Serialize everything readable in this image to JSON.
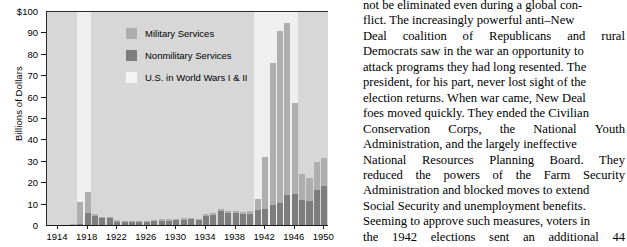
{
  "chart_data": {
    "type": "bar",
    "subtype": "stacked-bar",
    "title": "",
    "xlabel": "",
    "ylabel": "Billions of Dollars",
    "ylim": [
      0,
      100
    ],
    "ytick_values": [
      0,
      10,
      20,
      30,
      40,
      50,
      60,
      70,
      80,
      90,
      100
    ],
    "ytick_labels": [
      "0",
      "10",
      "20",
      "30",
      "40",
      "50",
      "60",
      "70",
      "80",
      "90",
      "$100"
    ],
    "xtick_labels": [
      "1914",
      "1918",
      "1922",
      "1926",
      "1930",
      "1934",
      "1938",
      "1942",
      "1946",
      "1950"
    ],
    "xtick_values": [
      1914,
      1918,
      1922,
      1926,
      1930,
      1934,
      1938,
      1942,
      1946,
      1950
    ],
    "xlim": [
      1912.5,
      1950.5
    ],
    "grid": false,
    "legend_position": "upper-center-left",
    "categories": [
      1913,
      1914,
      1915,
      1916,
      1917,
      1918,
      1919,
      1920,
      1921,
      1922,
      1923,
      1924,
      1925,
      1926,
      1927,
      1928,
      1929,
      1930,
      1931,
      1932,
      1933,
      1934,
      1935,
      1936,
      1937,
      1938,
      1939,
      1940,
      1941,
      1942,
      1943,
      1944,
      1945,
      1946,
      1947,
      1948,
      1949,
      1950
    ],
    "series": [
      {
        "name": "Nonmilitary Services",
        "color": "#7d7d7d",
        "values": [
          0.4,
          0.4,
          0.4,
          0.5,
          0.9,
          6.2,
          4.5,
          3.6,
          3.8,
          2.0,
          1.9,
          1.8,
          1.7,
          1.7,
          2.4,
          2.5,
          2.4,
          2.6,
          3.0,
          3.1,
          2.8,
          4.9,
          5.1,
          6.9,
          6.3,
          6.2,
          5.4,
          5.5,
          7.4,
          8.0,
          9.6,
          10.9,
          14.6,
          15.1,
          12.1,
          11.6,
          17.0,
          18.5
        ]
      },
      {
        "name": "Military Services",
        "color": "#aeaeae",
        "values": [
          0.2,
          0.2,
          0.2,
          0.3,
          10.5,
          9.5,
          1.0,
          0.8,
          0.6,
          0.7,
          0.6,
          0.6,
          0.6,
          0.6,
          0.6,
          0.7,
          0.7,
          0.7,
          0.7,
          0.7,
          0.6,
          0.7,
          0.8,
          0.9,
          0.9,
          1.0,
          1.2,
          1.7,
          5.0,
          24.3,
          66.4,
          80.2,
          80.5,
          42.3,
          12.4,
          10.9,
          12.8,
          13.5
        ]
      }
    ],
    "annotations": [
      {
        "label": "U.S. in World Wars I & II",
        "type": "band",
        "color": "#efefef",
        "ranges": [
          [
            1917,
            1918
          ],
          [
            1941,
            1946
          ]
        ]
      }
    ]
  },
  "legend": {
    "items": [
      {
        "label": "Military Services",
        "color": "#aeaeae",
        "swatch": "legend-swatch-military"
      },
      {
        "label": "Nonmilitary Services",
        "color": "#7d7d7d",
        "swatch": "legend-swatch-nonmilitary"
      },
      {
        "label": "U.S. in World Wars I & II",
        "color": "#f4f4f4",
        "swatch": "legend-swatch-wars"
      }
    ]
  },
  "body_text": {
    "lines": [
      {
        "text": "not be eliminated even during a global con-",
        "justify": false
      },
      {
        "text": "flict. The increasingly powerful anti–New",
        "justify": false
      },
      {
        "text": "Deal coalition of Republicans and rural",
        "justify": true,
        "words": [
          "Deal",
          "coalition",
          "of",
          "Republicans",
          "and",
          "rural"
        ]
      },
      {
        "text": "Democrats saw in the war an opportunity to",
        "justify": false
      },
      {
        "text": "attack programs they had long resented. The",
        "justify": false
      },
      {
        "text": "president, for his part, never lost sight of the",
        "justify": false
      },
      {
        "text": "election returns. When war came, New Deal",
        "justify": false
      },
      {
        "text": "foes moved quickly. They ended the Civilian",
        "justify": false
      },
      {
        "text": "Conservation Corps, the National Youth",
        "justify": true,
        "words": [
          "Conservation",
          "Corps,",
          "the",
          "National",
          "Youth"
        ]
      },
      {
        "text": "Administration, and the largely ineffective",
        "justify": false
      },
      {
        "text": "National Resources Planning Board. They",
        "justify": true,
        "words": [
          "National",
          "Resources",
          "Planning",
          "Board.",
          "They"
        ]
      },
      {
        "text": "reduced the powers of the Farm Security",
        "justify": true,
        "words": [
          "reduced",
          "the",
          "powers",
          "of",
          "the",
          "Farm",
          "Security"
        ]
      },
      {
        "text": "Administration and blocked moves to extend",
        "justify": false
      },
      {
        "text": "Social Security and unemployment benefits.",
        "justify": false
      },
      {
        "text": "Seeming to approve such measures, voters in",
        "justify": false
      },
      {
        "text": "the 1942 elections sent an additional 44",
        "justify": true,
        "words": [
          "the",
          "1942",
          "elections",
          "sent",
          "an",
          "additional",
          "44"
        ]
      }
    ]
  }
}
